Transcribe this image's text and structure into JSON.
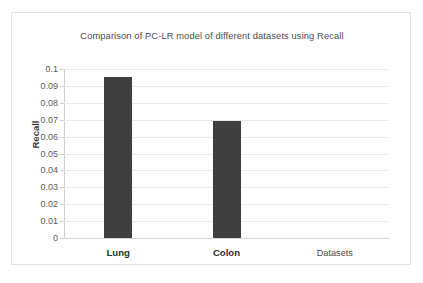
{
  "chart_data": {
    "type": "bar",
    "title": "Comparison of PC-LR model of different datasets using Recall",
    "xlabel": "Datasets",
    "ylabel": "Recall",
    "categories": [
      "Lung",
      "Colon"
    ],
    "values": [
      0.095,
      0.0695
    ],
    "ylim": [
      0,
      0.1
    ],
    "ytick_labels": [
      "0.1",
      "0.09",
      "0.08",
      "0.07",
      "0.06",
      "0.05",
      "0.04",
      "0.03",
      "0.02",
      "0.01",
      "0"
    ],
    "ytick_values": [
      0.1,
      0.09,
      0.08,
      0.07,
      0.06,
      0.05,
      0.04,
      0.03,
      0.02,
      0.01,
      0
    ],
    "grid": true,
    "legend": false,
    "bar_color": "#3f3f3f",
    "gridline_color": "#e8e8e8",
    "frame_color": "#e2e2e2",
    "background_color": "#ffffff"
  }
}
